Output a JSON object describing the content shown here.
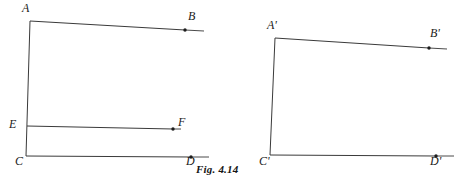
{
  "figure": {
    "caption": "Fig. 4.14",
    "background_color": "#ffffff",
    "line_color": "#3a3a3a",
    "label_color": "#1a1a1a",
    "panels": [
      {
        "name": "left-panel",
        "vertex_labels": [
          {
            "id": "A",
            "text": "A",
            "x": 22,
            "y": 2
          },
          {
            "id": "B",
            "text": "B",
            "x": 188,
            "y": 10
          },
          {
            "id": "E",
            "text": "E",
            "x": 9,
            "y": 118
          },
          {
            "id": "F",
            "text": "F",
            "x": 178,
            "y": 116
          },
          {
            "id": "C",
            "text": "C",
            "x": 15,
            "y": 155
          },
          {
            "id": "D",
            "text": "D",
            "x": 186,
            "y": 155
          }
        ],
        "segments": [
          {
            "id": "AC",
            "from": "A",
            "to": "C",
            "x1": 30,
            "y1": 21,
            "x2": 26,
            "y2": 156
          },
          {
            "id": "AB",
            "from": "A",
            "to": "B",
            "x1": 30,
            "y1": 21,
            "x2": 185,
            "y2": 30
          },
          {
            "id": "EF",
            "from": "E",
            "to": "F",
            "x1": 27,
            "y1": 126,
            "x2": 173,
            "y2": 129
          },
          {
            "id": "CD",
            "from": "C",
            "to": "D",
            "x1": 26,
            "y1": 156,
            "x2": 191,
            "y2": 157
          }
        ],
        "ray_tails": [
          {
            "id": "B-tail",
            "x1": 185,
            "y1": 30,
            "x2": 204,
            "y2": 31
          },
          {
            "id": "F-tail",
            "x1": 173,
            "y1": 129,
            "x2": 181,
            "y2": 129
          },
          {
            "id": "D-tail",
            "x1": 191,
            "y1": 157,
            "x2": 209,
            "y2": 157
          }
        ],
        "endpoint_dots": [
          {
            "id": "B-dot",
            "cx": 185,
            "cy": 30,
            "r": 1.7
          },
          {
            "id": "F-dot",
            "cx": 173,
            "cy": 129,
            "r": 1.7
          },
          {
            "id": "D-dot",
            "cx": 191,
            "cy": 157,
            "r": 1.7
          }
        ]
      },
      {
        "name": "right-panel",
        "vertex_labels": [
          {
            "id": "A-prime",
            "text": "A'",
            "x": 267,
            "y": 19
          },
          {
            "id": "B-prime",
            "text": "B'",
            "x": 430,
            "y": 27
          },
          {
            "id": "C-prime",
            "text": "C'",
            "x": 259,
            "y": 155
          },
          {
            "id": "D-prime",
            "text": "D'",
            "x": 430,
            "y": 155
          }
        ],
        "segments": [
          {
            "id": "A'C'",
            "from": "A'",
            "to": "C'",
            "x1": 275,
            "y1": 38,
            "x2": 270,
            "y2": 155
          },
          {
            "id": "A'B'",
            "from": "A'",
            "to": "B'",
            "x1": 275,
            "y1": 38,
            "x2": 429,
            "y2": 48
          },
          {
            "id": "C'D'",
            "from": "C'",
            "to": "D'",
            "x1": 270,
            "y1": 155,
            "x2": 436,
            "y2": 156
          }
        ],
        "ray_tails": [
          {
            "id": "B'-tail",
            "x1": 429,
            "y1": 48,
            "x2": 447,
            "y2": 49
          },
          {
            "id": "D'-tail",
            "x1": 436,
            "y1": 156,
            "x2": 454,
            "y2": 156
          }
        ],
        "endpoint_dots": [
          {
            "id": "B'-dot",
            "cx": 429,
            "cy": 48,
            "r": 1.7
          },
          {
            "id": "D'-dot",
            "cx": 436,
            "cy": 156,
            "r": 1.7
          }
        ]
      }
    ]
  }
}
